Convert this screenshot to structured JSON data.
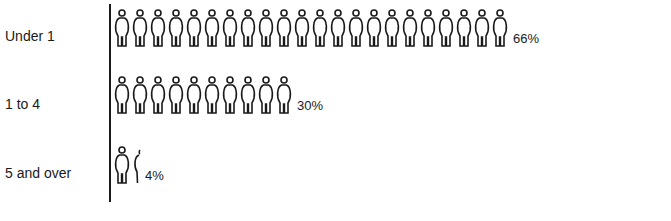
{
  "chart_data": {
    "type": "pictograph",
    "title": "",
    "categories": [
      "Under 1",
      "1 to 4",
      "5 and over"
    ],
    "values": [
      66,
      30,
      4
    ],
    "unit": "%",
    "icons_per_row": [
      22,
      10,
      1.33
    ],
    "icon": "person-figure",
    "value_labels": [
      "66%",
      "30%",
      "4%"
    ],
    "xlabel": "",
    "ylabel": ""
  },
  "rows": [
    {
      "label": "Under 1",
      "pct": "66%",
      "full": 22,
      "partial": false
    },
    {
      "label": "1 to 4",
      "pct": "30%",
      "full": 10,
      "partial": false
    },
    {
      "label": "5 and over",
      "pct": "4%",
      "full": 1,
      "partial": true
    }
  ],
  "caption": "...ths ...ed ...ld ...r... ...n ...a..."
}
